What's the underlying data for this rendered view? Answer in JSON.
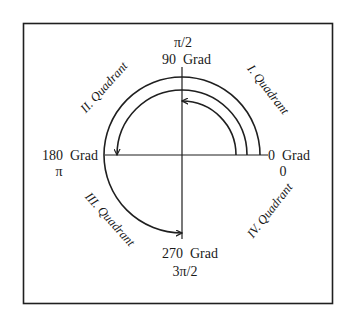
{
  "diagram": {
    "type": "unit-circle-angle-diagram",
    "axes": {
      "top": {
        "degrees": "90  Grad",
        "radians": "π/2"
      },
      "left": {
        "degrees": "180  Grad",
        "radians": "π"
      },
      "right": {
        "degrees": "0  Grad",
        "radians": "0"
      },
      "bottom": {
        "degrees": "270  Grad",
        "radians": "3π/2"
      }
    },
    "quadrants": [
      {
        "id": "I",
        "label": "I. Quadrant"
      },
      {
        "id": "II",
        "label": "II. Quadrant"
      },
      {
        "id": "III",
        "label": "III. Quadrant"
      },
      {
        "id": "IV",
        "label": "IV. Quadrant"
      }
    ],
    "arcs": [
      {
        "name": "inner",
        "from_deg": 0,
        "to_deg": 90
      },
      {
        "name": "middle",
        "from_deg": 0,
        "to_deg": 180
      },
      {
        "name": "outer",
        "from_deg": 0,
        "to_deg": 270
      }
    ],
    "colors": {
      "line": "#1f1f1f",
      "text": "#1a1a1a",
      "background": "#ffffff"
    }
  }
}
